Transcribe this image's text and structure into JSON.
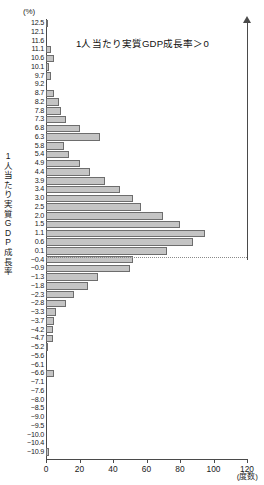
{
  "units": {
    "y_unit": "(%)",
    "x_unit": "(度数)"
  },
  "y_axis_title_chars": [
    "1",
    "人",
    "当",
    "た",
    "り",
    "実",
    "質",
    "G",
    "D",
    "P",
    "成",
    "長",
    "率"
  ],
  "annotation": {
    "text": "1人当たり実質GDP成長率＞0"
  },
  "colors": {
    "bar_fill": "#c4c4c4",
    "bar_stroke": "#6d6d6d",
    "axis": "#4a4a4a",
    "zero_line": "#8a8a8a",
    "text": "#1a1a1a"
  },
  "chart_data": {
    "type": "bar",
    "orientation": "horizontal",
    "title": "",
    "xlabel": "(度数)",
    "ylabel": "1人当たり実質GDP成長率",
    "ylim": [
      -10.9,
      12.5
    ],
    "xlim": [
      0,
      120
    ],
    "grid": false,
    "legend": false,
    "xticks": [
      0,
      20,
      40,
      60,
      80,
      100,
      120
    ],
    "categories": [
      "12.5",
      "12.1",
      "11.6",
      "11.1",
      "10.6",
      "10.1",
      "9.7",
      "9.2",
      "8.7",
      "8.2",
      "7.8",
      "7.3",
      "6.8",
      "6.3",
      "5.8",
      "5.4",
      "4.9",
      "4.4",
      "3.9",
      "3.4",
      "3.0",
      "2.5",
      "2.0",
      "1.5",
      "1.1",
      "0.6",
      "0.1",
      "-0.4",
      "-0.9",
      "-1.3",
      "-1.8",
      "-2.3",
      "-2.8",
      "-3.3",
      "-3.7",
      "-4.2",
      "-4.7",
      "-5.2",
      "-5.6",
      "-6.1",
      "-6.6",
      "-7.1",
      "-7.6",
      "-8.0",
      "-8.5",
      "-9.0",
      "-9.5",
      "-10.0",
      "-10.4",
      "-10.9"
    ],
    "values": [
      1,
      0,
      0,
      3,
      5,
      2,
      3,
      0,
      5,
      8,
      9,
      12,
      20,
      32,
      11,
      14,
      20,
      26,
      35,
      44,
      52,
      57,
      70,
      80,
      95,
      88,
      72,
      52,
      50,
      31,
      25,
      17,
      12,
      6,
      5,
      4,
      4,
      1,
      0,
      0,
      5,
      0,
      0,
      0,
      0,
      0,
      0,
      0,
      0,
      2
    ],
    "annotations": [
      {
        "text": "1人当たり実質GDP成長率＞0",
        "x": 30,
        "y": 11.1
      }
    ],
    "reference_lines": [
      {
        "orientation": "horizontal",
        "value": 0,
        "style": "dotted"
      }
    ]
  }
}
